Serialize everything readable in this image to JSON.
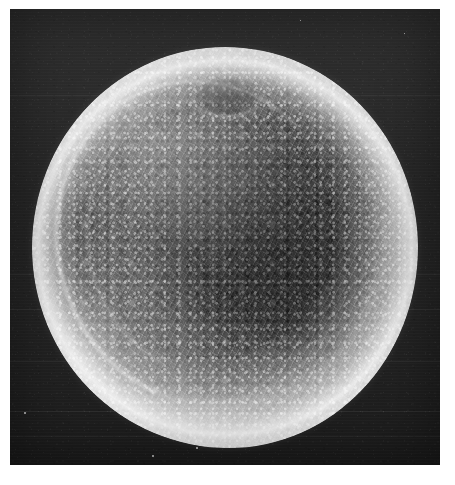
{
  "figure": {
    "kind": "sem-micrograph",
    "subject_label": "spherical specimen",
    "caption": "",
    "scale_bar_label": "",
    "magnification_label": "",
    "annotations": []
  },
  "plate": {
    "background_color": "#262626",
    "border_margin_color": "#ffffff",
    "left": 10,
    "top": 9,
    "width": 430,
    "height": 456
  },
  "specimen": {
    "shape": "sphere",
    "center_x": 225,
    "center_y": 247,
    "radius_x": 193,
    "radius_y": 200,
    "rim_color": "#ececec",
    "core_color": "#4a4a4a",
    "surface_texture": "reticulated fibrous mesh",
    "features": [
      {
        "name": "apex-depression",
        "x_pct": 50,
        "y_pct": 12
      },
      {
        "name": "arc-fold-upper-left",
        "x_pct": 30,
        "y_pct": 40
      },
      {
        "name": "bright-left-crescent",
        "x_pct": 14,
        "y_pct": 72
      }
    ]
  },
  "specks": [
    {
      "x": 24,
      "y": 412,
      "size": 2
    },
    {
      "x": 196,
      "y": 447,
      "size": 2
    },
    {
      "x": 152,
      "y": 455,
      "size": 2
    },
    {
      "x": 340,
      "y": 381,
      "size": 2
    },
    {
      "x": 300,
      "y": 20,
      "size": 1
    },
    {
      "x": 404,
      "y": 33,
      "size": 1
    }
  ]
}
